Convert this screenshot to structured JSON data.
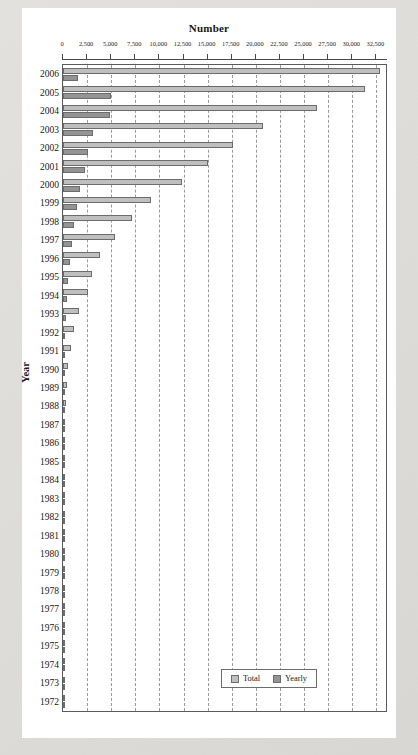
{
  "chart_data": {
    "type": "bar",
    "orientation": "horizontal",
    "title": "Number",
    "xlabel": "Number",
    "ylabel": "Year",
    "xlim": [
      0,
      33500
    ],
    "xticks": [
      0,
      2500,
      5000,
      7500,
      10000,
      12500,
      15000,
      17500,
      20000,
      22500,
      25000,
      27500,
      30000,
      32500
    ],
    "xtick_labels": [
      "0",
      "2,500",
      "5,000",
      "7,500",
      "10,000",
      "12,500",
      "15,000",
      "17,500",
      "20,000",
      "22,500",
      "25,000",
      "27,500",
      "30,000",
      "32,500"
    ],
    "grid": true,
    "grid_style": "dashed-vertical",
    "legend": {
      "position": "bottom-center-inside",
      "entries": [
        {
          "name": "Total",
          "color": "#bfbfbf"
        },
        {
          "name": "Yearly",
          "color": "#949494"
        }
      ]
    },
    "categories": [
      "2006",
      "2005",
      "2004",
      "2003",
      "2002",
      "2001",
      "2000",
      "1999",
      "1998",
      "1997",
      "1996",
      "1995",
      "1994",
      "1993",
      "1992",
      "1991",
      "1990",
      "1989",
      "1988",
      "1987",
      "1986",
      "1985",
      "1984",
      "1983",
      "1982",
      "1981",
      "1980",
      "1979",
      "1978",
      "1977",
      "1976",
      "1975",
      "1974",
      "1973",
      "1972"
    ],
    "series": [
      {
        "name": "Total",
        "color": "#bfbfbf",
        "values": [
          32900,
          31300,
          26300,
          20700,
          17600,
          15000,
          12300,
          9100,
          7200,
          5400,
          3800,
          3050,
          2600,
          1650,
          1150,
          800,
          560,
          390,
          270,
          190,
          140,
          105,
          80,
          60,
          45,
          35,
          28,
          22,
          17,
          13,
          10,
          8,
          6,
          4,
          3
        ]
      },
      {
        "name": "Yearly",
        "color": "#949494",
        "values": [
          1600,
          5000,
          4850,
          3100,
          2600,
          2300,
          1800,
          1500,
          1100,
          900,
          700,
          480,
          430,
          300,
          250,
          190,
          160,
          120,
          90,
          65,
          48,
          36,
          27,
          20,
          15,
          11,
          9,
          7,
          5,
          4,
          3,
          2,
          2,
          1,
          1
        ]
      }
    ]
  }
}
